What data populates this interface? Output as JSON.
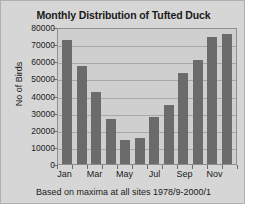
{
  "chart_data": {
    "type": "bar",
    "title": "Monthly Distribution of Tufted Duck",
    "xlabel": "Based on maxima at all sites 1978/9-2000/1",
    "ylabel": "No of Birds",
    "categories": [
      "Jan",
      "Feb",
      "Mar",
      "Apr",
      "May",
      "Jun",
      "Jul",
      "Aug",
      "Sep",
      "Oct",
      "Nov",
      "Dec"
    ],
    "visible_tick_labels": [
      "Jan",
      "Mar",
      "May",
      "Jul",
      "Sep",
      "Nov"
    ],
    "values": [
      72500,
      57000,
      42000,
      26000,
      14000,
      15000,
      27500,
      34500,
      53000,
      61000,
      74000,
      76000
    ],
    "ylim": [
      0,
      80000
    ],
    "ytick_labels": [
      "80000",
      "70000",
      "60000",
      "50000",
      "40000",
      "30000",
      "20000",
      "10000",
      "0"
    ],
    "ytick_values": [
      80000,
      70000,
      60000,
      50000,
      40000,
      30000,
      20000,
      10000,
      0
    ],
    "grid": true,
    "legend": false,
    "colors": {
      "bar": "#6b6b6b",
      "plot_background": "#cfcfcf",
      "card_background": "#d6d6d6",
      "gridline": "#a8a8a8",
      "axis": "#8e8e8e",
      "text": "#1a1a1a"
    }
  }
}
